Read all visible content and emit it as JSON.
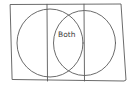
{
  "diagram": {
    "type": "venn",
    "style": "hand-drawn sketch",
    "stroke_color": "#5a5a5a",
    "background": "#ffffff",
    "sets": 2,
    "regions": [
      {
        "id": "left",
        "label": ""
      },
      {
        "id": "overlap",
        "label": "Both"
      },
      {
        "id": "right",
        "label": ""
      }
    ]
  }
}
